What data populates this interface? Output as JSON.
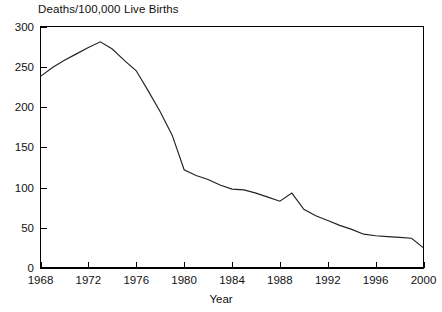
{
  "chart_data": {
    "type": "line",
    "title": "Deaths/100,000 Live Births",
    "xlabel": "Year",
    "ylabel": "",
    "grid": false,
    "legend": false,
    "xlim": [
      1968,
      2000
    ],
    "ylim": [
      0,
      300
    ],
    "xticks": [
      1968,
      1972,
      1976,
      1980,
      1984,
      1988,
      1992,
      1996,
      2000
    ],
    "xtick_labels": [
      "1968",
      "1972",
      "1976",
      "1980",
      "1984",
      "1988",
      "1992",
      "1996",
      "2000"
    ],
    "yticks": [
      0,
      50,
      100,
      150,
      200,
      250,
      300
    ],
    "ytick_labels": [
      "0",
      "50",
      "100",
      "150",
      "200",
      "250",
      "300"
    ],
    "x": [
      1968,
      1969,
      1970,
      1971,
      1972,
      1973,
      1974,
      1975,
      1976,
      1977,
      1978,
      1979,
      1980,
      1981,
      1982,
      1983,
      1984,
      1985,
      1986,
      1987,
      1988,
      1989,
      1990,
      1991,
      1992,
      1993,
      1994,
      1995,
      1996,
      1997,
      1998,
      1999,
      2000
    ],
    "values": [
      238,
      249,
      258,
      266,
      274,
      281,
      272,
      258,
      245,
      220,
      194,
      165,
      122,
      115,
      110,
      103,
      98,
      97,
      93,
      88,
      83,
      93,
      73,
      65,
      59,
      53,
      48,
      42,
      40,
      39,
      38,
      37,
      25
    ],
    "series": [
      {
        "name": "maternal-mortality-rate",
        "values": [
          238,
          249,
          258,
          266,
          274,
          281,
          272,
          258,
          245,
          220,
          194,
          165,
          122,
          115,
          110,
          103,
          98,
          97,
          93,
          88,
          83,
          93,
          73,
          65,
          59,
          53,
          48,
          42,
          40,
          39,
          38,
          37,
          25
        ]
      }
    ],
    "line_color": "#222222"
  }
}
